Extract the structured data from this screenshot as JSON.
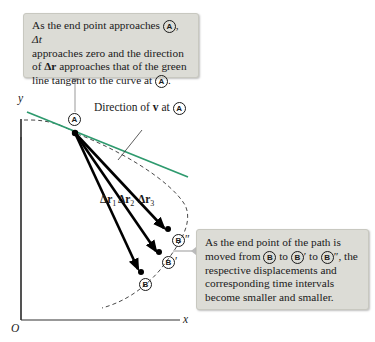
{
  "callouts": {
    "top": {
      "line1_a": "As the end point approaches ",
      "point_a": "A",
      "line1_b": ", ",
      "delta_t": "Δt",
      "line2": "approaches zero and the direction",
      "line3_a": "of ",
      "delta_r": "Δr",
      "line3_b": " approaches that of the green",
      "line4_a": "line tangent to the curve at ",
      "line4_b": "."
    },
    "right": {
      "line1": "As the end point of the path is",
      "line2_a": "moved from ",
      "point_b": "B",
      "line2_b": " to ",
      "point_b1": "B",
      "prime1": "′",
      "line2_c": " to ",
      "point_b2": "B",
      "prime2": "″",
      "line2_d": ", the",
      "line3": "respective displacements and",
      "line4": "corresponding time intervals",
      "line5": "become smaller and smaller."
    }
  },
  "labels": {
    "y_axis": "y",
    "x_axis": "x",
    "origin": "O",
    "direction_a": "Direction of ",
    "v_vec": "v",
    "direction_b": " at ",
    "point_a": "A",
    "dr1": "Δr",
    "dr1_sub": "1",
    "dr2": "Δr",
    "dr2_sub": "2",
    "dr3": "Δr",
    "dr3_sub": "3",
    "point_b": "B",
    "point_b1": "B′",
    "point_b2": "B″"
  },
  "colors": {
    "tangent_line": "#2e9a6e",
    "callout_bg": "#dcdcd6",
    "vectors": "#000000"
  }
}
